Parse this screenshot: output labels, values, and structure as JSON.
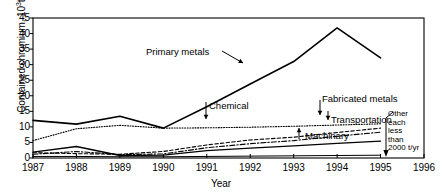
{
  "chart_data": {
    "type": "line",
    "title": "",
    "xlabel": "Year",
    "ylabel_text": "Contained chromium, 10",
    "ylabel_sup": "3",
    "ylabel_unit": "t",
    "ylabel_full": "Contained chromium, 10³t",
    "x": [
      1987,
      1988,
      1989,
      1990,
      1991,
      1992,
      1993,
      1994,
      1995
    ],
    "xlim": [
      1987,
      1996
    ],
    "ylim": [
      0,
      45
    ],
    "ytick_values": [
      0,
      5,
      10,
      15,
      20,
      25,
      30,
      35,
      40,
      45
    ],
    "xtick_labels": [
      "1987",
      "1988",
      "1989",
      "1990",
      "1991",
      "1992",
      "1993",
      "1994",
      "1995",
      "1996"
    ],
    "grid": false,
    "legend": "none (inline labels with arrows)",
    "series": [
      {
        "name": "Primary metals",
        "style": "solid",
        "width": 1.6,
        "values": [
          12.1,
          10.9,
          13.4,
          9.6,
          16.5,
          23.8,
          31.0,
          41.8,
          32.2
        ]
      },
      {
        "name": "Chemical",
        "style": "dotted",
        "width": 1.1,
        "values": [
          5.6,
          9.4,
          10.5,
          9.6,
          9.7,
          9.9,
          10.2,
          10.6,
          11.0
        ]
      },
      {
        "name": "Fabricated metals",
        "style": "dashed",
        "width": 1.1,
        "values": [
          1.7,
          1.4,
          1.2,
          2.1,
          4.2,
          5.8,
          6.7,
          8.2,
          9.6
        ]
      },
      {
        "name": "Transportation",
        "style": "dash-dot",
        "width": 1.1,
        "values": [
          1.2,
          2.1,
          1.1,
          1.3,
          3.3,
          4.6,
          5.6,
          7.0,
          8.3
        ]
      },
      {
        "name": "Machinary",
        "style": "solid",
        "width": 1.3,
        "values": [
          1.9,
          3.7,
          0.8,
          0.9,
          2.4,
          3.2,
          3.9,
          4.7,
          5.4
        ]
      },
      {
        "name": "Other each less than 2000 t/yr",
        "style": "solid-thin",
        "width": 1.0,
        "values": [
          0.5,
          0.5,
          0.4,
          0.4,
          0.5,
          0.6,
          0.7,
          0.8,
          0.9
        ]
      }
    ],
    "annotations": [
      {
        "name": "primary-metals",
        "label": "Primary metals",
        "arrow": "to-curve-right"
      },
      {
        "name": "chemical",
        "label": "Chemical",
        "arrow": "down"
      },
      {
        "name": "fabricated-metals",
        "label": "Fabricated metals",
        "arrow": "down"
      },
      {
        "name": "transportation",
        "label": "Transportation",
        "arrow": "down"
      },
      {
        "name": "machinary",
        "label": "Machinary",
        "arrow": "up"
      }
    ],
    "callout_box": {
      "lines": [
        "Other",
        "each",
        "less",
        "than",
        "2000 t/yr"
      ]
    }
  },
  "axis": {
    "xlabel": "Year",
    "ytick_0": "0",
    "ytick_5": "5",
    "ytick_10": "10",
    "ytick_15": "15",
    "ytick_20": "20",
    "ytick_25": "25",
    "ytick_30": "30",
    "ytick_35": "35",
    "ytick_40": "40",
    "ytick_45": "45"
  },
  "colors": {
    "line": "#000000",
    "axis": "#000000",
    "background": "#ffffff"
  }
}
